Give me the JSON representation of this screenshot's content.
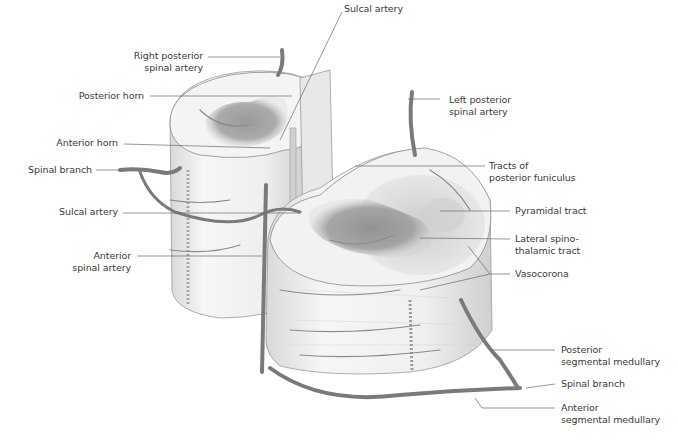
{
  "figure": {
    "labels": {
      "sulcal_artery_top": "Sulcal artery",
      "right_posterior_spinal_artery": [
        "Right posterior",
        "spinal artery"
      ],
      "left_posterior_spinal_artery": [
        "Left posterior",
        "spinal artery"
      ],
      "posterior_horn": "Posterior horn",
      "anterior_horn": "Anterior horn",
      "spinal_branch_left": "Spinal branch",
      "sulcal_artery_left": "Sulcal artery",
      "anterior_spinal_artery": [
        "Anterior",
        "spinal artery"
      ],
      "tracts_posterior_funiculus": [
        "Tracts of",
        "posterior funiculus"
      ],
      "pyramidal_tract": "Pyramidal tract",
      "lateral_spinothalamic_tract": [
        "Lateral spino-",
        "thalamic tract"
      ],
      "vasocorona": "Vasocorona",
      "posterior_segmental_medullary": [
        "Posterior",
        "segmental medullary"
      ],
      "spinal_branch_right": "Spinal branch",
      "anterior_segmental_medullary": [
        "Anterior",
        "segmental medullary"
      ]
    },
    "colors": {
      "background": "#ffffff",
      "cord_surface": "#efefef",
      "gray_matter": "#8f8f8f",
      "vessel": "#7a7a7a",
      "leader_line": "#6a6a6a",
      "label_text": "#3a3a3a"
    }
  }
}
